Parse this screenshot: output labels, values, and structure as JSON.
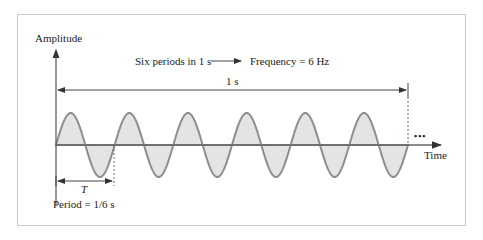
{
  "diagram": {
    "y_axis_label": "Amplitude",
    "x_axis_label": "Time",
    "header_left": "Six periods in 1 s",
    "header_right": "Frequency = 6 Hz",
    "span_label": "1 s",
    "period_symbol": "T",
    "period_caption": "Period = 1/6 s",
    "continuation": "•••",
    "cycles": 6,
    "colors": {
      "wave_stroke": "#8e8e8e",
      "wave_fill": "#e4e4e4",
      "axis": "#555555",
      "frame": "#c8c8c8"
    }
  }
}
